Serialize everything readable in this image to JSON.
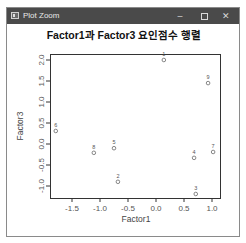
{
  "window": {
    "title": "Plot Zoom",
    "controls": {
      "minimize": "–",
      "maximize": "□",
      "close": "✕"
    }
  },
  "chart_data": {
    "type": "scatter",
    "title": "Factor1과 Factor3 요인점수 행렬",
    "xlabel": "Factor1",
    "ylabel": "Factor3",
    "xlim": [
      -1.9,
      1.15
    ],
    "ylim": [
      -1.3,
      2.1
    ],
    "xticks": [
      "-1.5",
      "-1.0",
      "-0.5",
      "0.0",
      "0.5",
      "1.0"
    ],
    "yticks": [
      "-1.0",
      "-0.5",
      "0.0",
      "0.5",
      "1.0",
      "1.5",
      "2.0"
    ],
    "grid": false,
    "legend": null,
    "points": [
      {
        "label": "1",
        "x": 0.14,
        "y": 2.0
      },
      {
        "label": "2",
        "x": -0.68,
        "y": -0.9
      },
      {
        "label": "3",
        "x": 0.71,
        "y": -1.19
      },
      {
        "label": "4",
        "x": 0.68,
        "y": -0.33
      },
      {
        "label": "5",
        "x": -0.75,
        "y": -0.1
      },
      {
        "label": "6",
        "x": -1.79,
        "y": 0.31
      },
      {
        "label": "7",
        "x": 1.02,
        "y": -0.19
      },
      {
        "label": "8",
        "x": -1.11,
        "y": -0.21
      },
      {
        "label": "9",
        "x": 0.93,
        "y": 1.45
      }
    ]
  }
}
